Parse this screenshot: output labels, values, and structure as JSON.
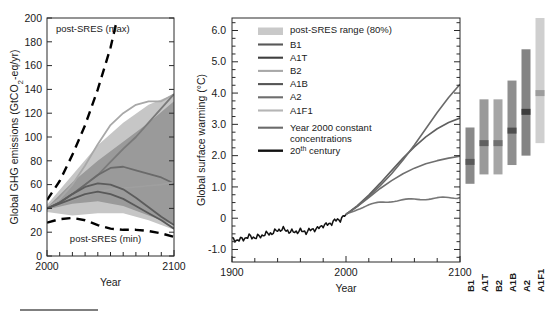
{
  "figure": {
    "name": "ipcc-emissions-and-warming-figure",
    "underline_rule": true
  },
  "chart_data": [
    {
      "id": "left-panel",
      "type": "line",
      "title": "",
      "xlabel": "Year",
      "ylabel": "Global GHG emissions (GtCO2-eq/yr)",
      "ylabel_parts": {
        "pre": "Global GHG emissions (GtCO",
        "sub": "2",
        "post": "-eq/yr)"
      },
      "xlim": [
        2000,
        2100
      ],
      "ylim": [
        0,
        200
      ],
      "xticks": [
        2000,
        2100
      ],
      "xticklabels": [
        "2000",
        "2100"
      ],
      "yticks": [
        0,
        20,
        40,
        60,
        80,
        100,
        120,
        140,
        160,
        180,
        200
      ],
      "yticklabels": [
        "0",
        "20",
        "40",
        "60",
        "80",
        "100",
        "120",
        "140",
        "160",
        "180",
        "200"
      ],
      "grid": false,
      "annotations": [
        {
          "name": "post-sres-max-label",
          "text": "post-SRES (max)",
          "x": 2007,
          "y": 188
        },
        {
          "name": "post-sres-min-label",
          "text": "post-SRES (min)",
          "x": 2018,
          "y": 12
        }
      ],
      "bands": [
        {
          "name": "post-SRES range (80%) outer",
          "color": "#c6c6c6",
          "x": [
            2000,
            2020,
            2040,
            2060,
            2080,
            2100,
            2100,
            2080,
            2060,
            2040,
            2020,
            2000
          ],
          "upper": [
            43,
            68,
            93,
            112,
            127,
            136,
            null,
            null,
            null,
            null,
            null,
            null
          ],
          "lower": [
            null,
            null,
            null,
            null,
            null,
            null,
            22,
            30,
            36,
            36,
            34,
            37
          ]
        },
        {
          "name": "SRES range inner",
          "color": "#9a9a9a",
          "x": [
            2000,
            2020,
            2040,
            2060,
            2080,
            2100,
            2100,
            2080,
            2060,
            2040,
            2020,
            2000
          ],
          "upper": [
            41,
            62,
            80,
            96,
            112,
            130,
            null,
            null,
            null,
            null,
            null,
            null
          ],
          "lower": [
            null,
            null,
            null,
            null,
            null,
            null,
            26,
            34,
            42,
            46,
            44,
            39
          ]
        }
      ],
      "series": [
        {
          "name": "A1F1",
          "color": "#a8a8a8",
          "width": 1.8,
          "x": [
            2000,
            2010,
            2020,
            2030,
            2040,
            2050,
            2060,
            2070,
            2080,
            2090,
            2100
          ],
          "y": [
            40,
            48,
            60,
            76,
            94,
            110,
            120,
            127,
            130,
            130,
            136
          ]
        },
        {
          "name": "A2",
          "color": "#7a7a7a",
          "width": 1.8,
          "x": [
            2000,
            2010,
            2020,
            2030,
            2040,
            2050,
            2060,
            2070,
            2080,
            2090,
            2100
          ],
          "y": [
            40,
            45,
            52,
            60,
            68,
            79,
            90,
            100,
            112,
            124,
            136
          ]
        },
        {
          "name": "A1B",
          "color": "#6a6a6a",
          "width": 1.8,
          "x": [
            2000,
            2010,
            2020,
            2030,
            2040,
            2050,
            2060,
            2070,
            2080,
            2090,
            2100
          ],
          "y": [
            40,
            45,
            52,
            60,
            68,
            74,
            75,
            72,
            69,
            66,
            61
          ]
        },
        {
          "name": "B2",
          "color": "#9f9f9f",
          "width": 1.6,
          "x": [
            2000,
            2010,
            2020,
            2030,
            2040,
            2050,
            2060,
            2070,
            2080,
            2090,
            2100
          ],
          "y": [
            40,
            43,
            47,
            51,
            54,
            56,
            57,
            58,
            59,
            60,
            62
          ]
        },
        {
          "name": "A1T",
          "color": "#5c5c5c",
          "width": 1.8,
          "x": [
            2000,
            2010,
            2020,
            2030,
            2040,
            2050,
            2060,
            2070,
            2080,
            2090,
            2100
          ],
          "y": [
            40,
            45,
            52,
            58,
            61,
            60,
            56,
            49,
            41,
            33,
            26
          ]
        },
        {
          "name": "B1",
          "color": "#595959",
          "width": 1.8,
          "x": [
            2000,
            2010,
            2020,
            2030,
            2040,
            2050,
            2060,
            2070,
            2080,
            2090,
            2100
          ],
          "y": [
            40,
            44,
            48,
            52,
            54,
            52,
            48,
            42,
            36,
            30,
            23
          ]
        },
        {
          "name": "post-SRES (max)",
          "color": "#000000",
          "width": 2.4,
          "dash": "9,6",
          "x": [
            2000,
            2010,
            2020,
            2030,
            2040,
            2050,
            2055
          ],
          "y": [
            47,
            63,
            85,
            110,
            140,
            175,
            198
          ]
        },
        {
          "name": "post-SRES (min)",
          "color": "#000000",
          "width": 2.4,
          "dash": "9,6",
          "x": [
            2000,
            2010,
            2020,
            2030,
            2040,
            2050,
            2060,
            2070,
            2080,
            2090,
            2100
          ],
          "y": [
            28,
            31,
            32,
            30,
            26,
            23,
            22,
            22,
            21,
            19,
            16
          ]
        }
      ]
    },
    {
      "id": "right-panel",
      "type": "line",
      "title": "",
      "xlabel": "Year",
      "ylabel": "Global surface warming (°C)",
      "xlim": [
        1900,
        2100
      ],
      "ylim": [
        -1.4,
        6.4
      ],
      "xticks": [
        1900,
        2000,
        2100
      ],
      "xticklabels": [
        "1900",
        "2000",
        "2100"
      ],
      "yticks": [
        -1.0,
        0,
        1.0,
        2.0,
        3.0,
        4.0,
        5.0,
        6.0
      ],
      "yticklabels": [
        "-1.0",
        "0",
        "1.0",
        "2.0",
        "3.0",
        "4.0",
        "5.0",
        "6.0"
      ],
      "grid": false,
      "series": [
        {
          "name": "20th century",
          "color": "#111111",
          "width": 1.5,
          "x": [
            1900,
            1905,
            1910,
            1915,
            1920,
            1925,
            1930,
            1935,
            1940,
            1945,
            1950,
            1955,
            1960,
            1965,
            1970,
            1975,
            1980,
            1985,
            1990,
            1995,
            2000
          ],
          "y": [
            -0.68,
            -0.7,
            -0.66,
            -0.58,
            -0.62,
            -0.57,
            -0.5,
            -0.48,
            -0.38,
            -0.35,
            -0.42,
            -0.44,
            -0.4,
            -0.44,
            -0.36,
            -0.34,
            -0.22,
            -0.2,
            -0.08,
            -0.04,
            0.12
          ]
        },
        {
          "name": "Year 2000 constant concentrations",
          "color": "#777777",
          "width": 1.6,
          "x": [
            2000,
            2010,
            2020,
            2030,
            2040,
            2050,
            2060,
            2070,
            2080,
            2090,
            2100
          ],
          "y": [
            0.12,
            0.3,
            0.42,
            0.5,
            0.55,
            0.58,
            0.6,
            0.62,
            0.64,
            0.65,
            0.66
          ]
        },
        {
          "name": "B1",
          "color": "#6f6f6f",
          "width": 1.6,
          "x": [
            2000,
            2010,
            2020,
            2030,
            2040,
            2050,
            2060,
            2070,
            2080,
            2090,
            2100
          ],
          "y": [
            0.12,
            0.38,
            0.66,
            0.95,
            1.2,
            1.42,
            1.6,
            1.74,
            1.84,
            1.92,
            1.98
          ]
        },
        {
          "name": "A1B",
          "color": "#5f5f5f",
          "width": 1.6,
          "x": [
            2000,
            2010,
            2020,
            2030,
            2040,
            2050,
            2060,
            2070,
            2080,
            2090,
            2100
          ],
          "y": [
            0.12,
            0.4,
            0.74,
            1.12,
            1.52,
            1.92,
            2.28,
            2.6,
            2.86,
            3.06,
            3.2
          ]
        },
        {
          "name": "A2",
          "color": "#6a6a6a",
          "width": 1.6,
          "x": [
            2000,
            2010,
            2020,
            2030,
            2040,
            2050,
            2060,
            2070,
            2080,
            2090,
            2100
          ],
          "y": [
            0.12,
            0.38,
            0.7,
            1.04,
            1.42,
            1.86,
            2.34,
            2.86,
            3.38,
            3.86,
            4.28
          ]
        }
      ],
      "legend": {
        "position": "upper-left",
        "entries": [
          {
            "name": "post-SRES range (80%)",
            "label": "post-SRES range (80%)",
            "type": "patch",
            "color": "#c9c9c9"
          },
          {
            "name": "B1",
            "label": "B1",
            "type": "line",
            "color": "#585858"
          },
          {
            "name": "A1T",
            "label": "A1T",
            "type": "line",
            "color": "#3f3f3f"
          },
          {
            "name": "B2",
            "label": "B2",
            "type": "line",
            "color": "#a8a8a8"
          },
          {
            "name": "A1B",
            "label": "A1B",
            "type": "line",
            "color": "#555555"
          },
          {
            "name": "A2",
            "label": "A2",
            "type": "line",
            "color": "#6e6e6e"
          },
          {
            "name": "A1F1",
            "label": "A1F1",
            "type": "line",
            "color": "#b5b5b5"
          },
          {
            "name": "Year 2000 constant concentrations",
            "label": "Year 2000 constant",
            "label2": "concentrations",
            "type": "line",
            "color": "#6b6b6b"
          },
          {
            "name": "20th century",
            "label": "20",
            "label_sup": "th",
            "label_post": " century",
            "type": "line",
            "color": "#111111"
          }
        ]
      },
      "bars": {
        "name": "scenario-warming-bars",
        "unit": "°C",
        "items": [
          {
            "name": "B1",
            "label": "B1",
            "low": 1.1,
            "high": 2.9,
            "best": 1.8,
            "color": "#8a8a8a",
            "best_color": "#5a5a5a",
            "label_color": "#1a1a1a"
          },
          {
            "name": "A1T",
            "label": "A1T",
            "low": 1.4,
            "high": 3.8,
            "best": 2.4,
            "color": "#9a9a9a",
            "best_color": "#5f5f5f",
            "label_color": "#1a1a1a"
          },
          {
            "name": "B2",
            "label": "B2",
            "low": 1.4,
            "high": 3.8,
            "best": 2.4,
            "color": "#a6a6a6",
            "best_color": "#707070",
            "label_color": "#555555"
          },
          {
            "name": "A1B",
            "label": "A1B",
            "low": 1.7,
            "high": 4.4,
            "best": 2.8,
            "color": "#8f8f8f",
            "best_color": "#4e4e4e",
            "label_color": "#1a1a1a"
          },
          {
            "name": "A2",
            "label": "A2",
            "low": 2.0,
            "high": 5.4,
            "best": 3.4,
            "color": "#848484",
            "best_color": "#3c3c3c",
            "label_color": "#1a1a1a"
          },
          {
            "name": "A1F1",
            "label": "A1F1",
            "low": 2.4,
            "high": 6.4,
            "best": 4.0,
            "color": "#cfcfcf",
            "best_color": "#9d9d9d",
            "label_color": "#8a8a8a"
          }
        ]
      }
    }
  ]
}
